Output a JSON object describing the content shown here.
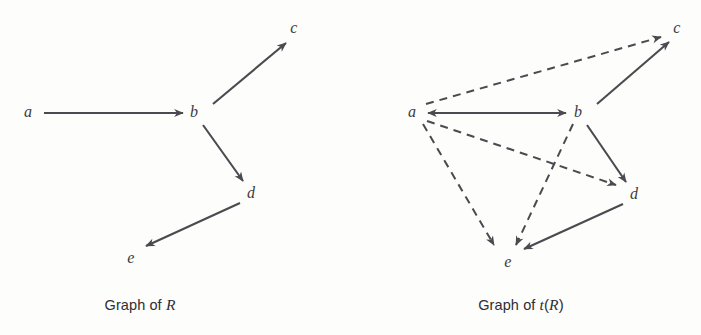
{
  "figure": {
    "background_color": "#fdfdfb",
    "stroke_color": "#4a4a50",
    "label_color": "#3b3b40",
    "width": 701,
    "height": 335
  },
  "panels": [
    {
      "id": "graph-of-r",
      "caption_prefix": "Graph of ",
      "caption_math": "R",
      "caption_suffix": "",
      "caption_x": 140,
      "caption_y": 296,
      "nodes": [
        {
          "id": "a",
          "label": "a",
          "x": 28,
          "y": 112
        },
        {
          "id": "b",
          "label": "b",
          "x": 194,
          "y": 112
        },
        {
          "id": "c",
          "label": "c",
          "x": 294,
          "y": 28
        },
        {
          "id": "d",
          "label": "d",
          "x": 251,
          "y": 193
        },
        {
          "id": "e",
          "label": "e",
          "x": 131,
          "y": 258
        }
      ],
      "edges": [
        {
          "from": "a",
          "to": "b",
          "style": "solid",
          "x1": 44,
          "y1": 113,
          "x2": 183,
          "y2": 113
        },
        {
          "from": "b",
          "to": "c",
          "style": "solid",
          "x1": 213,
          "y1": 104,
          "x2": 286,
          "y2": 43
        },
        {
          "from": "b",
          "to": "d",
          "style": "solid",
          "x1": 203,
          "y1": 125,
          "x2": 243,
          "y2": 181
        },
        {
          "from": "d",
          "to": "e",
          "style": "solid",
          "x1": 240,
          "y1": 203,
          "x2": 146,
          "y2": 246
        }
      ]
    },
    {
      "id": "graph-of-t-r",
      "caption_prefix": "Graph of ",
      "caption_math": "t",
      "caption_suffix": "(R)",
      "caption_x": 521,
      "caption_y": 296,
      "nodes": [
        {
          "id": "a",
          "label": "a",
          "x": 412,
          "y": 112
        },
        {
          "id": "b",
          "label": "b",
          "x": 578,
          "y": 112
        },
        {
          "id": "c",
          "label": "c",
          "x": 677,
          "y": 28
        },
        {
          "id": "d",
          "label": "d",
          "x": 634,
          "y": 194
        },
        {
          "id": "e",
          "label": "e",
          "x": 508,
          "y": 262
        }
      ],
      "edges": [
        {
          "from": "a",
          "to": "b",
          "style": "solid",
          "x1": 428,
          "y1": 113,
          "x2": 566,
          "y2": 113
        },
        {
          "from": "b",
          "to": "a",
          "style": "solid",
          "x1": 566,
          "y1": 113,
          "x2": 428,
          "y2": 113
        },
        {
          "from": "b",
          "to": "c",
          "style": "solid",
          "x1": 597,
          "y1": 104,
          "x2": 669,
          "y2": 42
        },
        {
          "from": "b",
          "to": "d",
          "style": "solid",
          "x1": 587,
          "y1": 125,
          "x2": 626,
          "y2": 182
        },
        {
          "from": "d",
          "to": "e",
          "style": "solid",
          "x1": 623,
          "y1": 204,
          "x2": 524,
          "y2": 249
        },
        {
          "from": "a",
          "to": "c",
          "style": "dashed",
          "x1": 426,
          "y1": 104,
          "x2": 661,
          "y2": 37
        },
        {
          "from": "a",
          "to": "d",
          "style": "dashed",
          "x1": 427,
          "y1": 121,
          "x2": 616,
          "y2": 185
        },
        {
          "from": "a",
          "to": "e",
          "style": "dashed",
          "x1": 423,
          "y1": 124,
          "x2": 494,
          "y2": 245
        },
        {
          "from": "b",
          "to": "e",
          "style": "dashed",
          "x1": 573,
          "y1": 124,
          "x2": 516,
          "y2": 245
        }
      ]
    }
  ]
}
